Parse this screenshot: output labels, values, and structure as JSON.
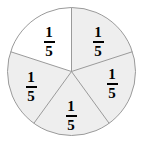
{
  "figure": {
    "background_color": "#ffffff",
    "width": 143,
    "height": 145
  },
  "circle": {
    "center_x": 71.5,
    "center_y": 71.5,
    "radius": 64,
    "stroke_color": "#9a9a9a",
    "stroke_width": 1,
    "shaded_fill_color": "#eeeeee",
    "unshaded_fill_color": "#ffffff"
  },
  "chart_data": {
    "type": "pie",
    "title": "",
    "categories": [
      "Slice 1",
      "Slice 2",
      "Slice 3",
      "Slice 4",
      "Slice 5"
    ],
    "values": [
      20,
      20,
      20,
      20,
      20
    ],
    "value_labels": [
      "1/5",
      "1/5",
      "1/5",
      "1/5",
      "1/5"
    ],
    "total_parts": 5,
    "shaded_count": 4,
    "unshaded_count": 1,
    "legend": "none",
    "grid": false
  },
  "slices": [
    {
      "id": "slice-top-right",
      "numerator": "1",
      "denominator": "5",
      "shaded": true,
      "start_angle": 90,
      "end_angle": 18,
      "label_x": 98,
      "label_y": 41
    },
    {
      "id": "slice-right",
      "numerator": "1",
      "denominator": "5",
      "shaded": true,
      "start_angle": 18,
      "end_angle": -54,
      "label_x": 112,
      "label_y": 83
    },
    {
      "id": "slice-bottom",
      "numerator": "1",
      "denominator": "5",
      "shaded": true,
      "start_angle": -54,
      "end_angle": -126,
      "label_x": 71,
      "label_y": 115
    },
    {
      "id": "slice-bottom-left",
      "numerator": "1",
      "denominator": "5",
      "shaded": true,
      "start_angle": -126,
      "end_angle": 162,
      "label_x": 31,
      "label_y": 86
    },
    {
      "id": "slice-top-left",
      "numerator": "1",
      "denominator": "5",
      "shaded": false,
      "start_angle": 162,
      "end_angle": 90,
      "label_x": 49,
      "label_y": 41
    }
  ]
}
